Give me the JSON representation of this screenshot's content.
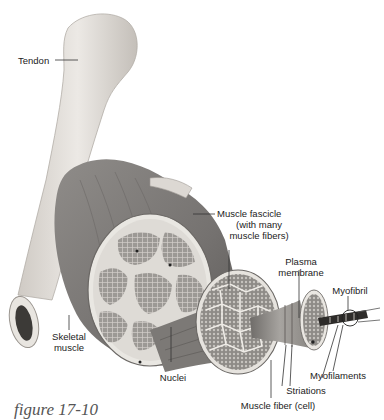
{
  "figure": {
    "caption": "figure 17-10"
  },
  "labels": {
    "tendon": "Tendon",
    "muscle_fascicle_1": "Muscle fascicle",
    "muscle_fascicle_2": "(with many",
    "muscle_fascicle_3": "muscle fibers)",
    "plasma_membrane_1": "Plasma",
    "plasma_membrane_2": "membrane",
    "myofibril": "Myofibril",
    "skeletal_muscle_1": "Skeletal",
    "skeletal_muscle_2": "muscle",
    "nuclei": "Nuclei",
    "myofilaments": "Myofilaments",
    "striations": "Striations",
    "muscle_fiber": "Muscle fiber (cell)"
  },
  "colors": {
    "bone": "#e6e3df",
    "bone_shadow": "#b9b4ae",
    "muscle": "#8a8784",
    "muscle_dark": "#5e5b58",
    "fascicle": "#a9a6a2",
    "connective": "#efeeea",
    "marrow": "#3a3835",
    "leader": "#333333"
  }
}
